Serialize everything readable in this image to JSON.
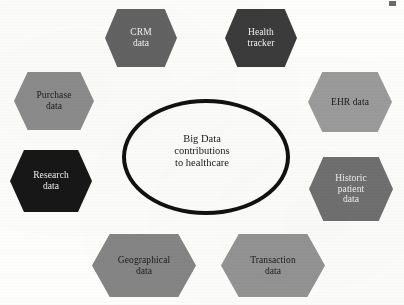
{
  "figure": {
    "type": "hub-and-spoke-diagram",
    "background_color": "#fdfdfc"
  },
  "center": {
    "label": "Big Data\ncontributions\nto healthcare",
    "shape": "ellipse",
    "outline_color": "#111111",
    "text_color": "#1a1a1a",
    "font_size_px": 10.5
  },
  "nodes": [
    {
      "id": "crm-data",
      "label": "CRM\ndata",
      "fill": "#636363",
      "text_color": "#f2f2f2",
      "position": "top-left-of-top",
      "x": 105,
      "y": 9,
      "w": 72,
      "h": 58,
      "font_size_px": 9.5
    },
    {
      "id": "health-tracker",
      "label": "Health\ntracker",
      "fill": "#3b3b3b",
      "text_color": "#f2f2f2",
      "position": "top-right-of-top",
      "x": 225,
      "y": 9,
      "w": 72,
      "h": 58,
      "font_size_px": 9.5
    },
    {
      "id": "purchase-data",
      "label": "Purchase\ndata",
      "fill": "#8c8c8c",
      "text_color": "#1b1b1b",
      "position": "upper-left",
      "x": 14,
      "y": 72,
      "w": 80,
      "h": 58,
      "font_size_px": 9.5
    },
    {
      "id": "ehr-data",
      "label": "EHR data",
      "fill": "#9b9b9b",
      "text_color": "#1b1b1b",
      "position": "upper-right",
      "x": 308,
      "y": 72,
      "w": 84,
      "h": 60,
      "font_size_px": 9.5
    },
    {
      "id": "research-data",
      "label": "Research\ndata",
      "fill": "#171717",
      "text_color": "#f0f0f0",
      "position": "lower-left",
      "x": 10,
      "y": 150,
      "w": 82,
      "h": 62,
      "font_size_px": 9.5
    },
    {
      "id": "historic-patient-data",
      "label": "Historic\npatient\ndata",
      "fill": "#707070",
      "text_color": "#f0f0f0",
      "position": "lower-right",
      "x": 309,
      "y": 157,
      "w": 84,
      "h": 64,
      "font_size_px": 9.5
    },
    {
      "id": "geographical-data",
      "label": "Geographical\ndata",
      "fill": "#858585",
      "text_color": "#1b1b1b",
      "position": "bottom-left",
      "x": 92,
      "y": 234,
      "w": 104,
      "h": 63,
      "font_size_px": 9.5
    },
    {
      "id": "transaction-data",
      "label": "Transaction\ndata",
      "fill": "#949494",
      "text_color": "#1b1b1b",
      "position": "bottom-right",
      "x": 221,
      "y": 234,
      "w": 104,
      "h": 63,
      "font_size_px": 9.5
    }
  ]
}
